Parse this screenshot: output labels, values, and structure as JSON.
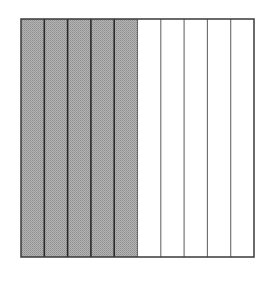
{
  "diagram": {
    "type": "fraction-area-model",
    "total_parts": 10,
    "shaded_parts": 5,
    "orientation": "vertical-strips",
    "shaded_side": "left",
    "colors": {
      "shaded_fill": "#a9a9a9",
      "shaded_divider": "#2a2a2a",
      "unshaded_fill": "#ffffff",
      "unshaded_divider": "#6a6a6a",
      "border": "#3a3a3a"
    },
    "box": {
      "x": 21,
      "y": 19,
      "width": 233,
      "height": 238
    }
  }
}
